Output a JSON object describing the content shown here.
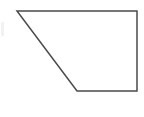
{
  "canvas": {
    "width": 144,
    "height": 117,
    "background_color": "#ffffff",
    "description": "Plain white canvas containing a single line-drawn geometric figure"
  },
  "figure": {
    "name": "quadrilateral",
    "shape_type": "trapezoid",
    "label": "",
    "fill_color": "#ffffff",
    "stroke_color": "#4a4a4a",
    "stroke_width": 1.5,
    "closed": true,
    "vertices": [
      {
        "name": "top-left",
        "x": 17,
        "y": 11
      },
      {
        "name": "top-right",
        "x": 137,
        "y": 11
      },
      {
        "name": "bottom-right",
        "x": 137,
        "y": 91
      },
      {
        "name": "bottom-left",
        "x": 77,
        "y": 91
      }
    ],
    "points_attr": "17,11 137,11 137,91 77,91",
    "edges": [
      {
        "name": "top-edge",
        "from": "top-left",
        "to": "top-right",
        "orientation": "horizontal"
      },
      {
        "name": "right-edge",
        "from": "top-right",
        "to": "bottom-right",
        "orientation": "vertical"
      },
      {
        "name": "bottom-edge",
        "from": "bottom-right",
        "to": "bottom-left",
        "orientation": "horizontal"
      },
      {
        "name": "left-edge",
        "from": "bottom-left",
        "to": "top-left",
        "orientation": "diagonal"
      }
    ]
  },
  "artifact": {
    "name": "left-edge-smudge",
    "x": 1,
    "y": 22,
    "width": 3,
    "height": 14,
    "color": "#f2f2f2"
  }
}
